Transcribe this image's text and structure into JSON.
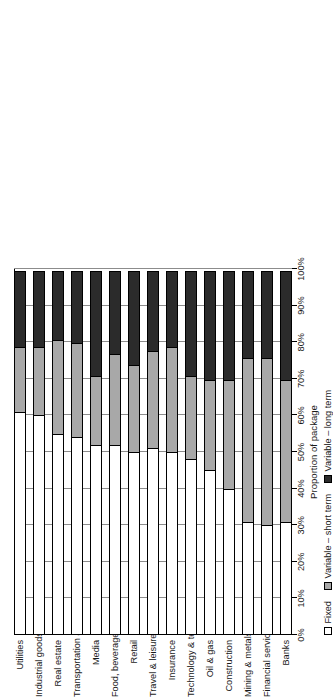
{
  "chart_data": {
    "type": "bar",
    "orientation": "horizontal",
    "stacked": true,
    "stack_mode": "percent",
    "title": "",
    "xlabel": "Proportion of package",
    "ylabel": "",
    "xlim": [
      0,
      100
    ],
    "xticks": [
      "0%",
      "10%",
      "20%",
      "30%",
      "40%",
      "50%",
      "60%",
      "70%",
      "80%",
      "90%",
      "100%"
    ],
    "xtick_values": [
      0,
      10,
      20,
      30,
      40,
      50,
      60,
      70,
      80,
      90,
      100
    ],
    "grid": true,
    "legend_position": "bottom",
    "categories": [
      "Utilities",
      "Industrial goods & services",
      "Real estate",
      "Transportation & business services",
      "Media",
      "Food, beverages & household goods",
      "Retail",
      "Travel & leisure",
      "Insurance",
      "Technology & telecommunications",
      "Oil & gas",
      "Construction",
      "Mining & metals",
      "Financial services",
      "Banks"
    ],
    "series": [
      {
        "name": "Fixed",
        "color": "#ffffff",
        "values": [
          61,
          60,
          55,
          54,
          52,
          52,
          50,
          51,
          50,
          48,
          45,
          40,
          31,
          30,
          31
        ]
      },
      {
        "name": "Variable – short term",
        "color": "#a8a8a8",
        "values": [
          18,
          19,
          26,
          26,
          19,
          25,
          24,
          27,
          29,
          23,
          25,
          30,
          45,
          46,
          39
        ]
      },
      {
        "name": "Variable – long term",
        "color": "#2b2b2b",
        "values": [
          21,
          21,
          19,
          20,
          29,
          23,
          26,
          22,
          21,
          29,
          30,
          30,
          24,
          24,
          30
        ]
      }
    ]
  },
  "legend": {
    "items": [
      {
        "label": "Fixed",
        "swatch": "fixed"
      },
      {
        "label": "Variable – short term",
        "swatch": "vshort"
      },
      {
        "label": "Variable – long term",
        "swatch": "vlong"
      }
    ]
  },
  "axis": {
    "x_title": "Proportion of package"
  }
}
